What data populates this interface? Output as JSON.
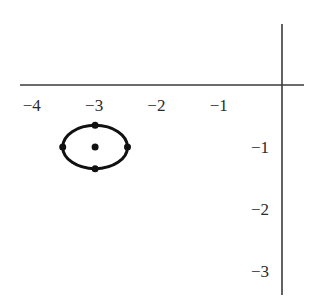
{
  "diagram": {
    "type": "coordinate-plane-with-ellipse",
    "colors": {
      "axis": "#3a3a3a",
      "shape": "#111111",
      "text": "#2a2a2a",
      "background": "#ffffff"
    },
    "axes": {
      "origin_px": [
        282,
        85
      ],
      "unit_px": [
        62.3,
        62
      ],
      "x_axis": {
        "from_px": 20,
        "to_px": 304
      },
      "y_axis": {
        "from_px": 24,
        "to_px": 295
      }
    },
    "x_ticks": [
      {
        "value": -4,
        "label": "−4"
      },
      {
        "value": -3,
        "label": "−3"
      },
      {
        "value": -2,
        "label": "−2"
      },
      {
        "value": -1,
        "label": "−1"
      }
    ],
    "y_ticks": [
      {
        "value": -1,
        "label": "−1"
      },
      {
        "value": -2,
        "label": "−2"
      },
      {
        "value": -3,
        "label": "−3"
      }
    ],
    "ellipse": {
      "center": [
        -3,
        -1
      ],
      "semi_axis_x": 0.52,
      "semi_axis_y": 0.35,
      "points": [
        {
          "name": "center",
          "coords": [
            -3,
            -1
          ]
        },
        {
          "name": "left-vertex",
          "coords": [
            -3.52,
            -1
          ]
        },
        {
          "name": "right-vertex",
          "coords": [
            -2.48,
            -1
          ]
        },
        {
          "name": "top-covertex",
          "coords": [
            -3,
            -0.65
          ]
        },
        {
          "name": "bottom-covertex",
          "coords": [
            -3,
            -1.35
          ]
        }
      ]
    }
  }
}
